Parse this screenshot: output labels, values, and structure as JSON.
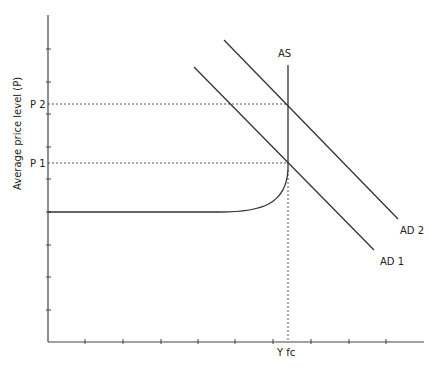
{
  "diagram": {
    "type": "economics-ad-as",
    "y_axis_label": "Average price level (P)",
    "x_axis_label": "",
    "price_levels": [
      {
        "id": "p1",
        "label": "P 1",
        "y": 163
      },
      {
        "id": "p2",
        "label": "P 2",
        "y": 104
      }
    ],
    "output_marker": {
      "label": "Y fc",
      "x": 288
    },
    "curves": [
      {
        "id": "as",
        "label": "AS",
        "kind": "aggregate-supply"
      },
      {
        "id": "ad1",
        "label": "AD 1",
        "kind": "aggregate-demand"
      },
      {
        "id": "ad2",
        "label": "AD 2",
        "kind": "aggregate-demand"
      }
    ],
    "line_color": "#333333",
    "dashed_color": "#555555"
  }
}
